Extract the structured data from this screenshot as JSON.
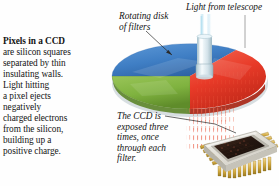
{
  "figure": {
    "caption": {
      "lead": "Pixels in a CCD",
      "lines": [
        "are silicon squares",
        "separated by thin",
        "insulating walls.",
        "Light hitting",
        "a pixel ejects",
        "negatively",
        "charged electrons",
        "from the silicon,",
        "building up a",
        "positive charge."
      ]
    },
    "labels": {
      "light_from_telescope": "Light from telescope",
      "rotating_disk": [
        "Rotating disk",
        "of filters"
      ],
      "ccd_exposed": [
        "The CCD is",
        "exposed three",
        "times, once",
        "through each",
        "filter."
      ]
    },
    "filters": [
      {
        "name": "blue-filter",
        "color": "#3f7ec4"
      },
      {
        "name": "green-filter",
        "color": "#7fb23f"
      },
      {
        "name": "red-filter",
        "color": "#e83a28"
      }
    ],
    "colors": {
      "blue": "#3f7ec4",
      "blue_dark": "#2f63a2",
      "green": "#7fb23f",
      "green_dark": "#638f2c",
      "red": "#e83a28",
      "red_dark": "#bd2717",
      "beam": "#bfe4f2",
      "beam_core": "#ffffff",
      "hub": "#d9e6ec",
      "chip_body": "#d8d6cf",
      "chip_sensor": "#2b1b12",
      "chip_pins": "#d2a93e",
      "leader_line": "#2a2a2a",
      "text": "#141414"
    },
    "chip": {
      "name": "ccd-sensor-chip",
      "pin_count_front": 11,
      "pin_count_side": 8
    }
  }
}
